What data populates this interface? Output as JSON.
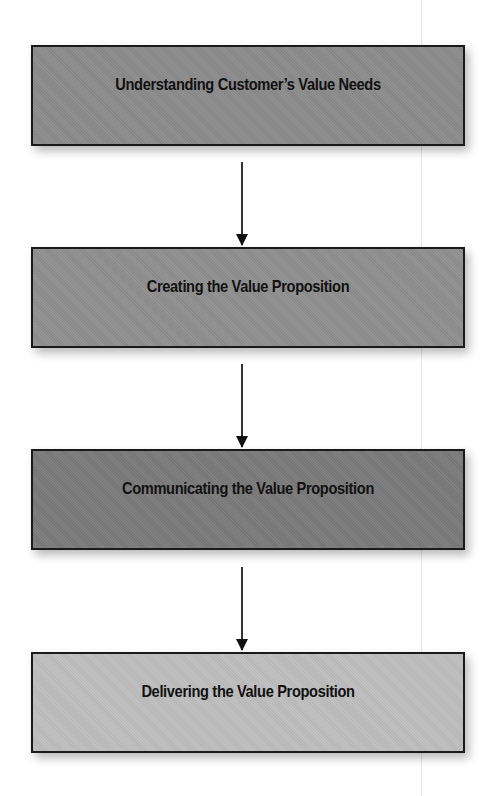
{
  "diagram": {
    "type": "vertical-flowchart",
    "steps": [
      {
        "label": "Understanding Customer’s Value Needs",
        "fill": "#8b8b8b"
      },
      {
        "label": "Creating the Value Proposition",
        "fill": "#8f8f8f"
      },
      {
        "label": "Communicating the Value Proposition",
        "fill": "#7a7a7a"
      },
      {
        "label": "Delivering the Value Proposition",
        "fill": "#bebebe"
      }
    ],
    "connectors": [
      {
        "from": 0,
        "to": 1,
        "icon": "down-arrow-icon"
      },
      {
        "from": 1,
        "to": 2,
        "icon": "down-arrow-icon"
      },
      {
        "from": 2,
        "to": 3,
        "icon": "down-arrow-icon"
      }
    ],
    "border_color": "#1a1a1a",
    "arrow_color": "#111111"
  }
}
